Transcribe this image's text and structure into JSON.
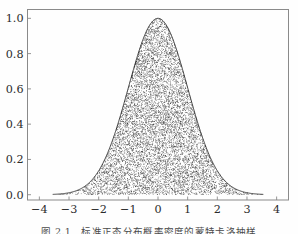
{
  "figure": {
    "background": "#fefefe",
    "frame_color": "#8a8a8a",
    "curve_color": "#1a1a1a",
    "scatter_color": "#111111",
    "caption": "图 2.1　标准正态分布概率密度的蒙特卡洛抽样"
  },
  "chart_data": {
    "type": "area",
    "title": "",
    "subtitle": "",
    "xlabel": "",
    "ylabel": "",
    "xlim": [
      -4.4,
      4.4
    ],
    "ylim": [
      -0.03,
      1.05
    ],
    "xticks": [
      -4,
      -3,
      -2,
      -1,
      0,
      1,
      2,
      3,
      4
    ],
    "xticklabels": [
      "−4",
      "−3",
      "−2",
      "−1",
      "0",
      "1",
      "2",
      "3",
      "4"
    ],
    "yticks": [
      0.0,
      0.2,
      0.4,
      0.6,
      0.8,
      1.0
    ],
    "yticklabels": [
      "0.0",
      "0.2",
      "0.4",
      "0.6",
      "0.8",
      "1.0"
    ],
    "grid": false,
    "legend": null,
    "legend_position": "none",
    "series": [
      {
        "name": "gaussian-envelope",
        "kind": "line",
        "formula": "exp(-x^2/2)",
        "peak_x": 0.0,
        "peak_y": 1.0,
        "sigma": 1.0,
        "x_start": -3.55,
        "x_end": 3.55,
        "x": [
          -3.5,
          -3.25,
          -3.0,
          -2.75,
          -2.5,
          -2.25,
          -2.0,
          -1.75,
          -1.5,
          -1.25,
          -1.0,
          -0.75,
          -0.5,
          -0.25,
          0.0,
          0.25,
          0.5,
          0.75,
          1.0,
          1.25,
          1.5,
          1.75,
          2.0,
          2.25,
          2.5,
          2.75,
          3.0,
          3.25,
          3.5
        ],
        "values": [
          0.0022,
          0.0054,
          0.0111,
          0.0224,
          0.0439,
          0.0796,
          0.1353,
          0.2163,
          0.3247,
          0.4578,
          0.6065,
          0.7548,
          0.8825,
          0.9692,
          1.0,
          0.9692,
          0.8825,
          0.7548,
          0.6065,
          0.4578,
          0.3247,
          0.2163,
          0.1353,
          0.0796,
          0.0439,
          0.0224,
          0.0111,
          0.0054,
          0.0022
        ]
      },
      {
        "name": "monte-carlo-samples",
        "kind": "scatter",
        "marker": "dot",
        "marker_size": 0.55,
        "count": 9000,
        "description": "uniform rejection samples filling the region under the gaussian envelope"
      }
    ]
  }
}
